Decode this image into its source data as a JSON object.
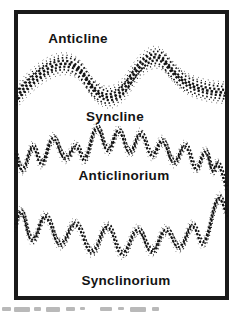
{
  "figure": {
    "labels": {
      "anticline": "Anticline",
      "syncline": "Syncline",
      "anticlinorium": "Anticlinorium",
      "synclinorium": "Synclinorium"
    },
    "colors": {
      "ink": "#141414",
      "frame": "#1a1a1a",
      "background": "#ffffff",
      "caption_remnant": "#a8a8a8"
    },
    "bands": [
      {
        "name": "anticline-syncline-band"
      },
      {
        "name": "anticlinorium-band"
      },
      {
        "name": "synclinorium-band"
      }
    ]
  }
}
